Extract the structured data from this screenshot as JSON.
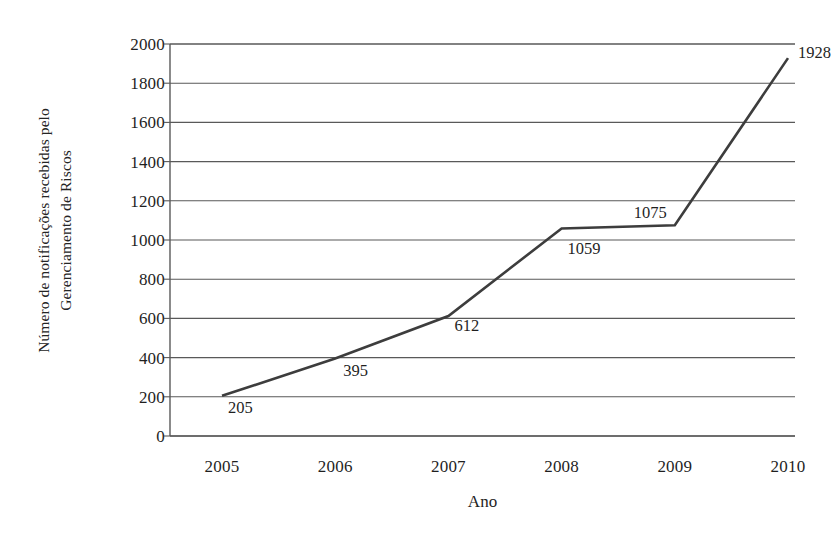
{
  "chart_data": {
    "type": "line",
    "title": "",
    "xlabel": "Ano",
    "ylabel_line1": "Número de notificações recebidas pelo",
    "ylabel_line2": "Gerenciamento de Riscos",
    "categories": [
      "2005",
      "2006",
      "2007",
      "2008",
      "2009",
      "2010"
    ],
    "values": [
      205,
      395,
      612,
      1059,
      1075,
      1928
    ],
    "point_labels": [
      "205",
      "395",
      "612",
      "1059",
      "1075",
      "1928"
    ],
    "ylim": [
      0,
      2000
    ],
    "yticks": [
      2000,
      1800,
      1600,
      1400,
      1200,
      1000,
      800,
      600,
      400,
      200,
      0
    ],
    "ytick_labels": [
      "2000",
      "1800",
      "1600",
      "1400",
      "1200",
      "1000",
      "800",
      "600",
      "400",
      "200",
      "0"
    ],
    "grid": true,
    "grid_axis": "y",
    "legend": false,
    "legend_position": "none",
    "series": [
      {
        "name": "Notificações",
        "values": [
          205,
          395,
          612,
          1059,
          1075,
          1928
        ]
      }
    ],
    "colors": {
      "line": "#3d3d3d",
      "grid": "#595959",
      "axis": "#595959",
      "background": "#ffffff",
      "text": "#1f1f1f"
    }
  }
}
